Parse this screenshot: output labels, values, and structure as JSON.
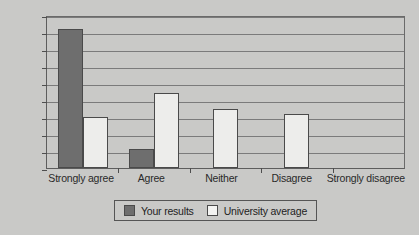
{
  "chart_data": {
    "type": "bar",
    "title": "",
    "xlabel": "",
    "ylabel": "",
    "ylim": [
      0,
      90
    ],
    "ytick_step": 10,
    "yticks": [
      0,
      10,
      20,
      30,
      40,
      50,
      60,
      70,
      80,
      90
    ],
    "grid": true,
    "legend_position": "bottom",
    "categories": [
      "Strongly agree",
      "Agree",
      "Neither",
      "Disagree",
      "Strongly disagree"
    ],
    "series": [
      {
        "name": "Your results",
        "color": "#6e6e6e",
        "values": [
          82,
          11,
          0,
          0,
          0
        ]
      },
      {
        "name": "University average",
        "color": "#ededeb",
        "values": [
          30,
          44,
          35,
          32,
          0
        ]
      }
    ]
  },
  "legend": {
    "items": [
      {
        "label": "Your results",
        "color": "#6e6e6e"
      },
      {
        "label": "University average",
        "color": "#f3f3f1"
      }
    ]
  },
  "colors": {
    "background": "#c9c9c7",
    "axis": "#4e4e4e",
    "gridline": "#7b7b7b",
    "text": "#2a2a2a",
    "series_your_results": "#6e6e6e",
    "series_university_average": "#ededeb"
  }
}
